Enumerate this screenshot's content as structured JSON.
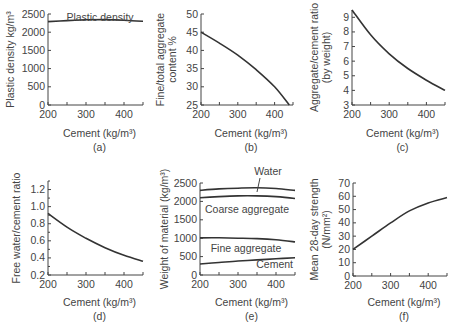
{
  "chart_data": [
    {
      "id": "a",
      "type": "line",
      "caption": "(a)",
      "title": "Plastic density",
      "xlabel": "Cement (kg/m³)",
      "ylabel": "Plastic density kg/m³",
      "xlim": [
        200,
        450
      ],
      "ylim": [
        0,
        2500
      ],
      "xticks": [
        200,
        300,
        400
      ],
      "yticks": [
        0,
        500,
        1000,
        1500,
        2000,
        2500
      ],
      "series": [
        {
          "name": "Plastic density",
          "x": [
            200,
            250,
            300,
            350,
            400,
            450
          ],
          "y": [
            2290,
            2320,
            2340,
            2345,
            2330,
            2300
          ]
        }
      ]
    },
    {
      "id": "b",
      "type": "line",
      "caption": "(b)",
      "xlabel": "Cement (kg/m³)",
      "ylabel": "Fine/total aggregate content %",
      "xlim": [
        200,
        450
      ],
      "ylim": [
        25,
        50
      ],
      "xticks": [
        200,
        300,
        400
      ],
      "yticks": [
        25,
        30,
        35,
        40,
        45,
        50
      ],
      "series": [
        {
          "name": "Fine/total aggregate",
          "x": [
            200,
            250,
            300,
            350,
            400,
            440
          ],
          "y": [
            45,
            42,
            38.7,
            34.7,
            30,
            25
          ]
        }
      ]
    },
    {
      "id": "c",
      "type": "line",
      "caption": "(c)",
      "xlabel": "Cement (kg/m³)",
      "ylabel": "Aggregate/cement ratio (by weight)",
      "xlim": [
        200,
        450
      ],
      "ylim": [
        3,
        9.5
      ],
      "xticks": [
        200,
        300,
        400
      ],
      "yticks": [
        3,
        4,
        5,
        6,
        7,
        8,
        9
      ],
      "series": [
        {
          "name": "Aggregate/cement ratio",
          "x": [
            200,
            250,
            300,
            350,
            400,
            450
          ],
          "y": [
            9.5,
            7.8,
            6.5,
            5.5,
            4.7,
            4.0
          ]
        }
      ]
    },
    {
      "id": "d",
      "type": "line",
      "caption": "(d)",
      "xlabel": "Cement (kg/m³)",
      "ylabel": "Free water/cement ratio",
      "xlim": [
        200,
        450
      ],
      "ylim": [
        0.2,
        1.3
      ],
      "xticks": [
        200,
        300,
        400
      ],
      "yticks": [
        0.2,
        0.4,
        0.6,
        0.8,
        1.0,
        1.2
      ],
      "series": [
        {
          "name": "Free water/cement ratio",
          "x": [
            200,
            250,
            300,
            350,
            400,
            450
          ],
          "y": [
            0.92,
            0.76,
            0.63,
            0.52,
            0.43,
            0.36
          ]
        }
      ]
    },
    {
      "id": "e",
      "type": "line",
      "caption": "(e)",
      "xlabel": "Cement (kg/m³)",
      "ylabel": "Weight of material (kg/m³)",
      "xlim": [
        200,
        450
      ],
      "ylim": [
        0,
        2500
      ],
      "xticks": [
        200,
        300,
        400
      ],
      "yticks": [
        0,
        500,
        1000,
        1500,
        2000,
        2500
      ],
      "annotations": [
        "Water",
        "Coarse aggregate",
        "Fine aggregate",
        "Cement"
      ],
      "series": [
        {
          "name": "Water (cumulative top)",
          "x": [
            200,
            250,
            300,
            350,
            400,
            450
          ],
          "y": [
            2300,
            2340,
            2360,
            2370,
            2350,
            2300
          ]
        },
        {
          "name": "Coarse aggregate (cumulative)",
          "x": [
            200,
            250,
            300,
            350,
            400,
            450
          ],
          "y": [
            2100,
            2130,
            2150,
            2150,
            2130,
            2080
          ]
        },
        {
          "name": "Fine aggregate (cumulative)",
          "x": [
            200,
            250,
            300,
            350,
            400,
            450
          ],
          "y": [
            1010,
            1010,
            1000,
            990,
            960,
            900
          ]
        },
        {
          "name": "Cement",
          "x": [
            200,
            250,
            300,
            350,
            400,
            450
          ],
          "y": [
            300,
            340,
            380,
            410,
            440,
            470
          ]
        }
      ]
    },
    {
      "id": "f",
      "type": "line",
      "caption": "(f)",
      "xlabel": "Cement (kg/m³)",
      "ylabel": "Mean 28-day strength (N/mm²)",
      "xlim": [
        200,
        450
      ],
      "ylim": [
        0,
        70
      ],
      "xticks": [
        200,
        300,
        400
      ],
      "yticks": [
        0,
        10,
        20,
        30,
        40,
        50,
        60,
        70
      ],
      "series": [
        {
          "name": "Mean 28-day strength",
          "x": [
            200,
            250,
            300,
            350,
            400,
            450
          ],
          "y": [
            20,
            30,
            40,
            49,
            55,
            59
          ]
        }
      ]
    }
  ]
}
